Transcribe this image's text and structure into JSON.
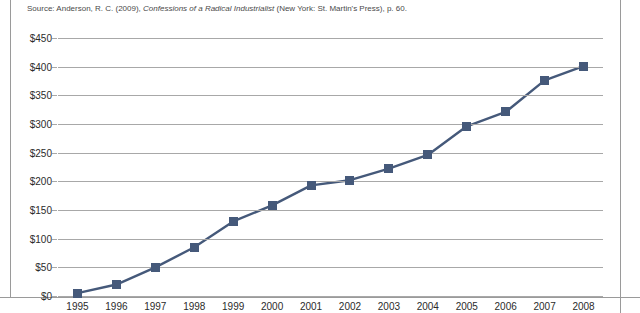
{
  "source": {
    "prefix": "Source: Anderson, R. C. (2009), ",
    "title": "Confessions of a Radical Industrialist",
    "suffix": " (New York: St. Martin's Press), p. 60."
  },
  "colors": {
    "series": "#45597a",
    "gridline": "#a8a8a8",
    "text": "#2b2b2b",
    "frame_rule": "#9a9a9a"
  },
  "chart_data": {
    "type": "line",
    "title": "",
    "xlabel": "",
    "ylabel": "",
    "ylim": [
      0,
      450
    ],
    "ytick_step": 50,
    "grid": true,
    "legend": "none",
    "marker": "square",
    "ytick_labels": [
      "$450",
      "$400",
      "$350",
      "$300",
      "$250",
      "$200",
      "$150",
      "$100",
      "$50",
      "$0"
    ],
    "ytick_values": [
      450,
      400,
      350,
      300,
      250,
      200,
      150,
      100,
      50,
      0
    ],
    "categories": [
      "1995",
      "1996",
      "1997",
      "1998",
      "1999",
      "2000",
      "2001",
      "2002",
      "2003",
      "2004",
      "2005",
      "2006",
      "2007",
      "2008"
    ],
    "series": [
      {
        "name": "Cumulative value",
        "values": [
          5,
          20,
          50,
          85,
          130,
          158,
          193,
          202,
          222,
          246,
          296,
          321,
          376,
          401
        ]
      }
    ]
  }
}
